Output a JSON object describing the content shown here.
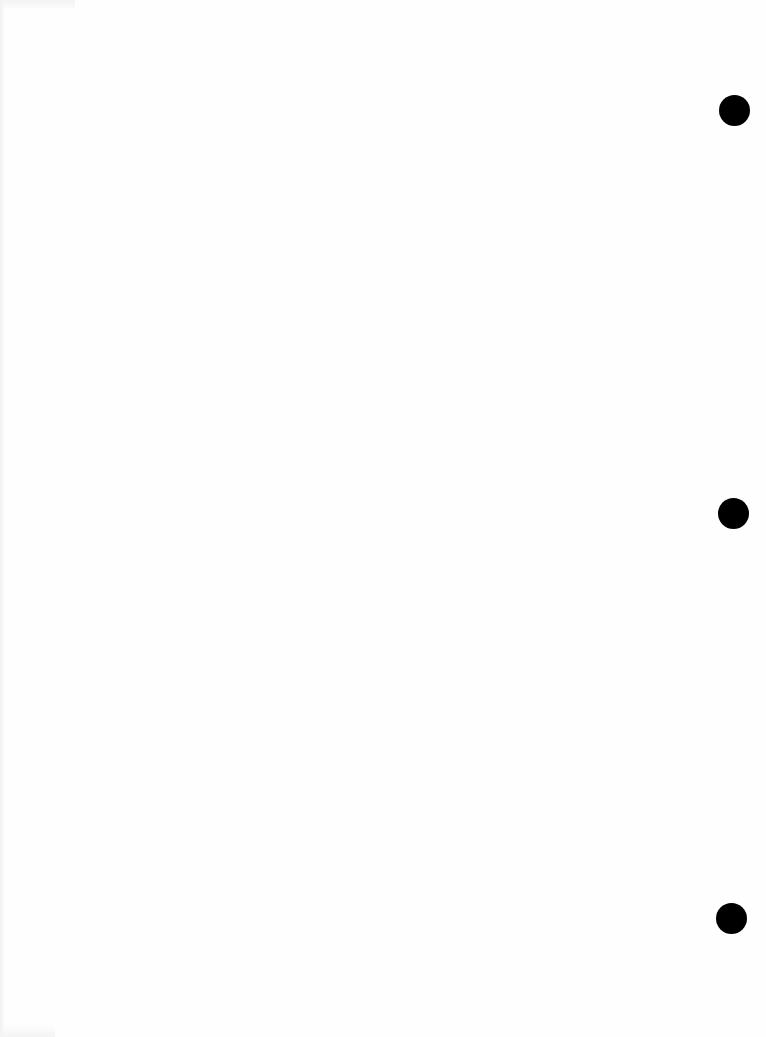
{
  "document": {
    "type": "blank-hole-punched-paper",
    "background_color": "#fefefe",
    "text_content": "",
    "punch_holes": [
      {
        "name": "top",
        "center_x": 734,
        "center_y": 110,
        "diameter": 31,
        "color": "#000000"
      },
      {
        "name": "middle",
        "center_x": 733,
        "center_y": 513,
        "diameter": 31,
        "color": "#000000"
      },
      {
        "name": "bottom",
        "center_x": 731,
        "center_y": 918,
        "diameter": 31,
        "color": "#000000"
      }
    ]
  }
}
